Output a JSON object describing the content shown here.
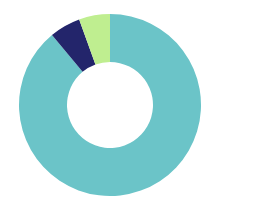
{
  "chart_data": {
    "type": "pie",
    "variant": "donut",
    "title": "",
    "subtitle": "",
    "xlabel": "",
    "ylabel": "",
    "grid": false,
    "legend_position": "none",
    "labels_shown": false,
    "background_color": "#ffffff",
    "center": {
      "cx": 110,
      "cy": 105
    },
    "outer_radius": 91,
    "inner_radius": 43,
    "start_angle_deg": 0,
    "direction": "clockwise",
    "categories": [
      "Segment 1",
      "Segment 2",
      "Segment 3"
    ],
    "values": [
      89.0,
      5.5,
      5.5
    ],
    "slices": [
      {
        "name": "Segment 1",
        "value": 89.0,
        "percent": "89%",
        "color": "#6BC4C8",
        "start_angle_deg": 0,
        "end_angle_deg": 320.4
      },
      {
        "name": "Segment 2",
        "value": 5.5,
        "percent": "5.5%",
        "color": "#23256B",
        "start_angle_deg": 320.4,
        "end_angle_deg": 340.2
      },
      {
        "name": "Segment 3",
        "value": 5.5,
        "percent": "5.5%",
        "color": "#BFEE90",
        "start_angle_deg": 340.2,
        "end_angle_deg": 360
      }
    ],
    "colors": [
      "#6BC4C8",
      "#23256B",
      "#BFEE90"
    ]
  }
}
